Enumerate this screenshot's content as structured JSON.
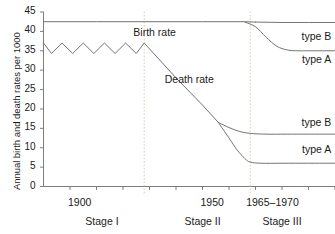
{
  "chart_data": {
    "type": "line",
    "title": "",
    "subtitle": "",
    "xlabel": "",
    "ylabel": "Annual birth and death rates per 1000",
    "ylim": [
      0,
      45
    ],
    "xlim": [
      1890,
      2000
    ],
    "grid": false,
    "legend_position": "inline-right",
    "y_ticks": [
      "0",
      "5",
      "10",
      "15",
      "20",
      "25",
      "30",
      "35",
      "40",
      "45"
    ],
    "y_tick_values": [
      0,
      5,
      10,
      15,
      20,
      25,
      30,
      35,
      40,
      45
    ],
    "x_tick_labels": [
      "1900",
      "1950",
      "1965–1970"
    ],
    "x_tick_positions": [
      1900,
      1950,
      1968
    ],
    "stages": [
      {
        "label": "Stage I",
        "center_x": 1912
      },
      {
        "label": "Stage II",
        "center_x": 1950
      },
      {
        "label": "Stage III",
        "center_x": 1980
      }
    ],
    "stage_dividers": [
      1928,
      1968
    ],
    "annotations": [
      {
        "text": "Birth rate",
        "x": 1932,
        "y": 39.5
      },
      {
        "text": "Death rate",
        "x": 1945,
        "y": 27.5
      },
      {
        "text": "type B",
        "x": 1990,
        "y": 38.5,
        "series": "birth-rate-type-b"
      },
      {
        "text": "type A",
        "x": 1990,
        "y": 32.5,
        "series": "birth-rate-type-a"
      },
      {
        "text": "type B",
        "x": 1990,
        "y": 16.5,
        "series": "death-rate-type-b"
      },
      {
        "text": "type A",
        "x": 1990,
        "y": 9.5,
        "series": "death-rate-type-a"
      }
    ],
    "series": [
      {
        "name": "Birth rate",
        "color": "#6b6b6b",
        "x": [
          1890,
          1900,
          1910,
          1920,
          1928,
          1940,
          1950,
          1960,
          1966,
          1970
        ],
        "values": [
          42.5,
          42.5,
          42.5,
          42.5,
          42.5,
          42.5,
          42.5,
          42.5,
          42.5,
          42.4
        ]
      },
      {
        "name": "Birth rate type B",
        "color": "#6b6b6b",
        "x": [
          1970,
          1980,
          1990,
          2000
        ],
        "values": [
          42.4,
          42.3,
          42.3,
          42.3
        ]
      },
      {
        "name": "Birth rate type A",
        "color": "#6b6b6b",
        "x": [
          1966,
          1970,
          1974,
          1978,
          1982,
          1986,
          1990,
          2000
        ],
        "values": [
          42.4,
          41.2,
          38.5,
          36.2,
          35.2,
          35.0,
          35.0,
          35.0
        ]
      },
      {
        "name": "Death rate",
        "color": "#6b6b6b",
        "x": [
          1890,
          1893,
          1897,
          1901,
          1905,
          1909,
          1913,
          1917,
          1921,
          1925,
          1928,
          1940,
          1950,
          1956
        ],
        "values": [
          37.0,
          34.3,
          37.0,
          34.3,
          37.0,
          34.3,
          37.0,
          34.3,
          37.0,
          34.3,
          37.0,
          28.0,
          21.0,
          16.5
        ]
      },
      {
        "name": "Death rate type B",
        "color": "#6b6b6b",
        "x": [
          1956,
          1960,
          1964,
          1968,
          1974,
          1982,
          1990,
          2000
        ],
        "values": [
          16.5,
          15.2,
          14.2,
          13.7,
          13.5,
          13.5,
          13.5,
          13.5
        ]
      },
      {
        "name": "Death rate type A",
        "color": "#6b6b6b",
        "x": [
          1956,
          1960,
          1963,
          1966,
          1968,
          1972,
          1980,
          1990,
          2000
        ],
        "values": [
          16.5,
          12.5,
          9.5,
          7.2,
          6.3,
          6.0,
          6.0,
          6.0,
          6.0
        ]
      }
    ]
  }
}
